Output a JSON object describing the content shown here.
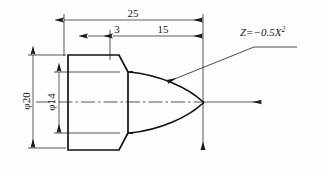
{
  "drawing": {
    "title": "parabolic-nose-shaft-section",
    "units": "mm",
    "formula": {
      "base": "Z=−0.5X",
      "exponent": "2",
      "full": "Z=-0.5X^2"
    },
    "dimensions": {
      "overall_length": "25",
      "chamfer_length": "3",
      "nose_length": "15",
      "outer_diameter": "φ20",
      "inner_diameter": "φ14"
    },
    "colors": {
      "outline": "#121212",
      "thin_line": "#2a2a2a",
      "text": "#1a1a1a",
      "background": "#fdfdfd"
    },
    "labels": {
      "axis_arrow": "x-axis-arrow",
      "vertical_axis_arrow": "z-axis-arrow"
    }
  }
}
